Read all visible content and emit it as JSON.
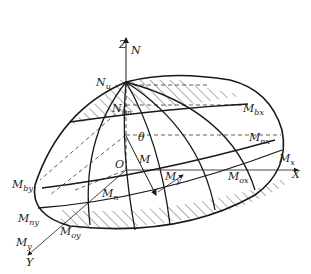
{
  "diagram": {
    "type": "3d-interaction-surface",
    "colors": {
      "stroke": "#1a1a1a",
      "hatch": "#333333",
      "background": "#ffffff"
    },
    "axes": {
      "z": {
        "label": "Z",
        "force_label": "N"
      },
      "x": {
        "label": "X",
        "moment_label": "M",
        "moment_sub": "x"
      },
      "y": {
        "label": "Y",
        "moment_label": "M",
        "moment_sub": "y"
      },
      "origin": "O"
    },
    "labels": {
      "Nu": {
        "main": "N",
        "sub": "u"
      },
      "Nbn": {
        "main": "N",
        "sub": "bn"
      },
      "Mbx": {
        "main": "M",
        "sub": "bx"
      },
      "Mnx": {
        "main": "M",
        "sub": "nx"
      },
      "Mox": {
        "main": "M",
        "sub": "ox"
      },
      "Mby": {
        "main": "M",
        "sub": "by"
      },
      "Mny": {
        "main": "M",
        "sub": "ny"
      },
      "Moy": {
        "main": "M",
        "sub": "oy"
      },
      "Mn": {
        "main": "M",
        "sub": "n"
      },
      "M": {
        "main": "M"
      },
      "My_inner": {
        "main": "M",
        "sub": "y"
      },
      "theta": {
        "main": "θ"
      }
    }
  }
}
